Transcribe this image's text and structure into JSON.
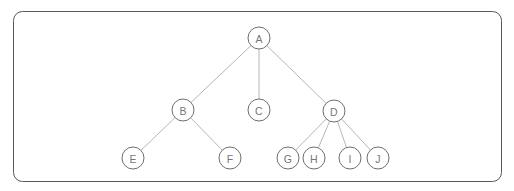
{
  "diagram": {
    "type": "rooted-tree",
    "frame": {
      "x": 13,
      "y": 11,
      "width": 488,
      "height": 170,
      "corner_radius": 9,
      "stroke_color": "#58585a",
      "fill_color": "#ffffff"
    },
    "style": {
      "node_radius": 11,
      "node_stroke_color": "#6e6e70",
      "node_fill_color": "#ffffff",
      "edge_color": "#b6b6b8",
      "label_color": "#76767a"
    },
    "nodes": [
      {
        "id": "A",
        "label": "A",
        "cx": 259,
        "cy": 38,
        "level": 0
      },
      {
        "id": "B",
        "label": "B",
        "cx": 183,
        "cy": 110,
        "level": 1
      },
      {
        "id": "C",
        "label": "C",
        "cx": 259,
        "cy": 110,
        "level": 1
      },
      {
        "id": "D",
        "label": "D",
        "cx": 334,
        "cy": 111,
        "level": 1
      },
      {
        "id": "E",
        "label": "E",
        "cx": 133,
        "cy": 158,
        "level": 2
      },
      {
        "id": "F",
        "label": "F",
        "cx": 230,
        "cy": 158,
        "level": 2
      },
      {
        "id": "G",
        "label": "G",
        "cx": 288,
        "cy": 158,
        "level": 2
      },
      {
        "id": "H",
        "label": "H",
        "cx": 314,
        "cy": 158,
        "level": 2
      },
      {
        "id": "I",
        "label": "I",
        "cx": 350,
        "cy": 158,
        "level": 2
      },
      {
        "id": "J",
        "label": "J",
        "cx": 378,
        "cy": 158,
        "level": 2
      }
    ],
    "edges": [
      {
        "from": "A",
        "to": "B"
      },
      {
        "from": "A",
        "to": "C"
      },
      {
        "from": "A",
        "to": "D"
      },
      {
        "from": "B",
        "to": "E"
      },
      {
        "from": "B",
        "to": "F"
      },
      {
        "from": "D",
        "to": "G"
      },
      {
        "from": "D",
        "to": "H"
      },
      {
        "from": "D",
        "to": "I"
      },
      {
        "from": "D",
        "to": "J"
      }
    ]
  }
}
